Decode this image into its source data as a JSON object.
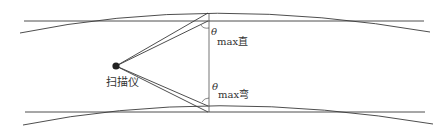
{
  "diagram": {
    "scanner_label": "扫描仪",
    "theta_symbol": "θ",
    "angle_straight": {
      "sub_prefix": "max",
      "sub_suffix": "直"
    },
    "angle_curved": {
      "sub_prefix": "max",
      "sub_suffix": "弯"
    },
    "colors": {
      "line": "#3a3a3a",
      "text": "#333333",
      "background": "#ffffff"
    }
  }
}
